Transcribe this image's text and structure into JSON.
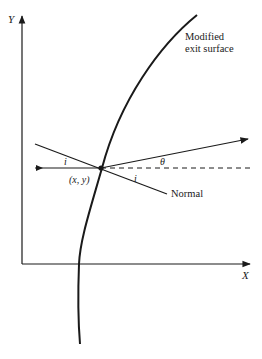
{
  "diagram": {
    "axes": {
      "y_label": "Y",
      "x_label": "X"
    },
    "surface_label_line1": "Modified",
    "surface_label_line2": "exit surface",
    "point_label": "(x, y)",
    "incident_angle_label": "i",
    "normal_angle_label": "i",
    "refraction_angle_label": "θ",
    "normal_label": "Normal",
    "colors": {
      "ink": "#1a1a1a",
      "background": "#ffffff"
    }
  }
}
